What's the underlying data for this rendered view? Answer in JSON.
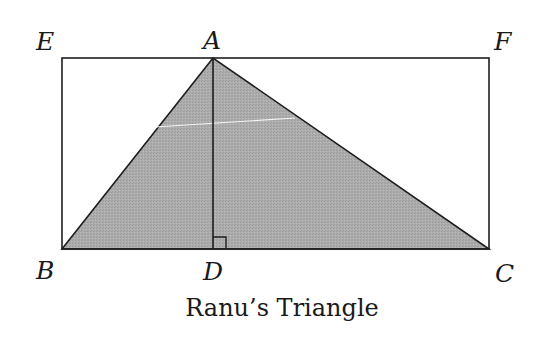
{
  "figure": {
    "caption": "Ranu’s Triangle",
    "points": {
      "A": {
        "label": "A",
        "x": 213,
        "y": 58
      },
      "B": {
        "label": "B",
        "x": 62,
        "y": 249
      },
      "C": {
        "label": "C",
        "x": 489,
        "y": 249
      },
      "D": {
        "label": "D",
        "x": 213,
        "y": 249
      },
      "E": {
        "label": "E",
        "x": 62,
        "y": 58
      },
      "F": {
        "label": "F",
        "x": 489,
        "y": 58
      }
    },
    "rectangle": [
      "E",
      "F",
      "C",
      "B"
    ],
    "triangle": [
      "A",
      "B",
      "C"
    ],
    "altitude": [
      "A",
      "D"
    ],
    "right_angle_at": "D",
    "colors": {
      "stroke": "#1e1e1e",
      "triangle_fill": "#a8a8a8",
      "background": "#ffffff"
    }
  }
}
